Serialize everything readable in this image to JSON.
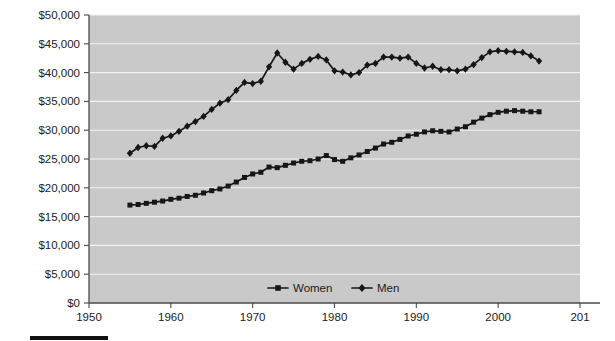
{
  "chart_data": {
    "type": "line",
    "title": "",
    "subtitle": "",
    "xlabel": "",
    "ylabel": "",
    "xlim": [
      1950,
      2010
    ],
    "ylim": [
      0,
      50000
    ],
    "grid": true,
    "legend_position": "bottom-center",
    "x_ticks": [
      "1950",
      "1960",
      "1970",
      "1980",
      "1990",
      "2000",
      "201"
    ],
    "x_tick_values": [
      1950,
      1960,
      1970,
      1980,
      1990,
      2000,
      2010
    ],
    "y_ticks": [
      "$0",
      "$5,000",
      "$10,000",
      "$15,000",
      "$20,000",
      "$25,000",
      "$30,000",
      "$35,000",
      "$40,000",
      "$45,000",
      "$50,000"
    ],
    "y_tick_values": [
      0,
      5000,
      10000,
      15000,
      20000,
      25000,
      30000,
      35000,
      40000,
      45000,
      50000
    ],
    "x": [
      1955,
      1956,
      1957,
      1958,
      1959,
      1960,
      1961,
      1962,
      1963,
      1964,
      1965,
      1966,
      1967,
      1968,
      1969,
      1970,
      1971,
      1972,
      1973,
      1974,
      1975,
      1976,
      1977,
      1978,
      1979,
      1980,
      1981,
      1982,
      1983,
      1984,
      1985,
      1986,
      1987,
      1988,
      1989,
      1990,
      1991,
      1992,
      1993,
      1994,
      1995,
      1996,
      1997,
      1998,
      1999,
      2000,
      2001,
      2002,
      2003,
      2004,
      2005
    ],
    "series": [
      {
        "name": "Women",
        "marker": "square",
        "color": "#161616",
        "values": [
          17000,
          17100,
          17300,
          17500,
          17700,
          18000,
          18200,
          18500,
          18700,
          19100,
          19500,
          19800,
          20300,
          21000,
          21800,
          22400,
          22700,
          23600,
          23500,
          23900,
          24300,
          24600,
          24700,
          25000,
          25600,
          24900,
          24600,
          25200,
          25700,
          26300,
          26900,
          27600,
          27900,
          28400,
          29000,
          29300,
          29700,
          29900,
          29800,
          29700,
          30200,
          30600,
          31400,
          32100,
          32700,
          33100,
          33300,
          33400,
          33300,
          33200,
          33200
        ]
      },
      {
        "name": "Men",
        "marker": "diamond",
        "color": "#161616",
        "values": [
          26000,
          27000,
          27300,
          27200,
          28600,
          29000,
          29800,
          30700,
          31500,
          32400,
          33600,
          34700,
          35300,
          36900,
          38300,
          38100,
          38500,
          41000,
          43400,
          41800,
          40600,
          41600,
          42300,
          42800,
          42200,
          40300,
          40100,
          39600,
          40000,
          41300,
          41600,
          42700,
          42700,
          42500,
          42700,
          41600,
          40800,
          41100,
          40500,
          40500,
          40300,
          40600,
          41400,
          42600,
          43600,
          43800,
          43700,
          43600,
          43500,
          42900,
          42000
        ]
      }
    ],
    "legend": [
      {
        "label": "Women",
        "marker": "square"
      },
      {
        "label": "Men",
        "marker": "diamond"
      }
    ]
  },
  "caption": {
    "text": ""
  }
}
